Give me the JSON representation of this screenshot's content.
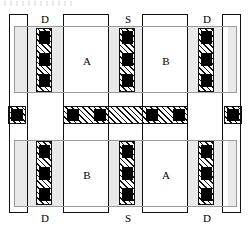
{
  "figure": {
    "type": "ic-layout-diagram",
    "width": 251,
    "height": 230,
    "background": "#ffffff"
  },
  "colors": {
    "active_fill": "#e9e9e9",
    "active_stroke": "#9a9a9a",
    "metal_fill": "#ffffff",
    "metal_stroke": "#111111",
    "hatch_stroke": "#111111",
    "contact_fill": "#000000",
    "label_color": "#000000"
  },
  "labels": {
    "top": [
      {
        "text": "D",
        "x": 45,
        "y": 13
      },
      {
        "text": "S",
        "x": 128,
        "y": 13
      },
      {
        "text": "D",
        "x": 207,
        "y": 13
      }
    ],
    "bottom": [
      {
        "text": "D",
        "x": 45,
        "y": 213
      },
      {
        "text": "S",
        "x": 128,
        "y": 213
      },
      {
        "text": "D",
        "x": 207,
        "y": 213
      }
    ],
    "regions": [
      {
        "text": "A",
        "x": 87,
        "y": 61,
        "row": "top",
        "cell": "left"
      },
      {
        "text": "B",
        "x": 166,
        "y": 61,
        "row": "top",
        "cell": "right"
      },
      {
        "text": "B",
        "x": 87,
        "y": 175,
        "row": "bottom",
        "cell": "left"
      },
      {
        "text": "A",
        "x": 166,
        "y": 175,
        "row": "bottom",
        "cell": "right"
      }
    ]
  },
  "active_regions": [
    {
      "name": "top-active",
      "x": 14,
      "y": 26,
      "w": 223,
      "h": 67
    },
    {
      "name": "bottom-active",
      "x": 14,
      "y": 140,
      "w": 223,
      "h": 67
    }
  ],
  "metal_lines": [
    {
      "name": "metal-line-1",
      "x": 9,
      "y": 14,
      "w": 19,
      "h": 199
    },
    {
      "name": "metal-line-2",
      "x": 63,
      "y": 14,
      "w": 46,
      "h": 199
    },
    {
      "name": "metal-line-3",
      "x": 142,
      "y": 14,
      "w": 46,
      "h": 199
    },
    {
      "name": "metal-line-4",
      "x": 222,
      "y": 14,
      "w": 19,
      "h": 199
    }
  ],
  "contact_columns": [
    {
      "name": "contact-column-d-top-left",
      "x": 36,
      "y": 28,
      "w": 16,
      "h": 64,
      "contacts": 3
    },
    {
      "name": "contact-column-s-top",
      "x": 119,
      "y": 28,
      "w": 16,
      "h": 64,
      "contacts": 3
    },
    {
      "name": "contact-column-d-top-right",
      "x": 198,
      "y": 28,
      "w": 16,
      "h": 64,
      "contacts": 3
    },
    {
      "name": "contact-column-d-bottom-left",
      "x": 36,
      "y": 141,
      "w": 16,
      "h": 64,
      "contacts": 3
    },
    {
      "name": "contact-column-s-bottom",
      "x": 119,
      "y": 141,
      "w": 16,
      "h": 64,
      "contacts": 3
    },
    {
      "name": "contact-column-d-bottom-right",
      "x": 198,
      "y": 141,
      "w": 16,
      "h": 64,
      "contacts": 3
    }
  ],
  "center_band": {
    "name": "center-gate-band",
    "x": 63,
    "y": 106,
    "w": 125,
    "h": 18,
    "contacts": [
      {
        "x": 67,
        "y": 109,
        "w": 11,
        "h": 11
      },
      {
        "x": 94,
        "y": 109,
        "w": 11,
        "h": 11
      },
      {
        "x": 146,
        "y": 109,
        "w": 11,
        "h": 11
      },
      {
        "x": 173,
        "y": 109,
        "w": 11,
        "h": 11
      }
    ]
  },
  "side_taps": [
    {
      "name": "side-tap-left",
      "x": 8,
      "y": 106,
      "w": 17,
      "h": 18
    },
    {
      "name": "side-tap-right",
      "x": 225,
      "y": 106,
      "w": 17,
      "h": 18
    }
  ]
}
